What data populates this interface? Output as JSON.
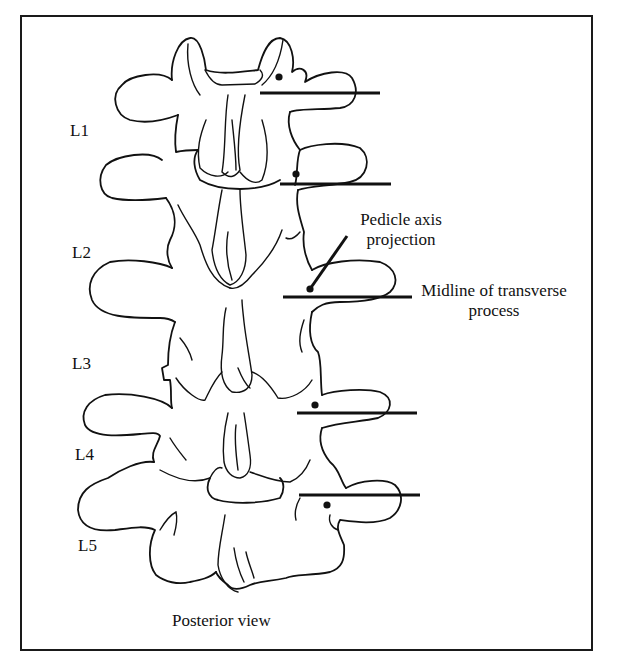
{
  "figure": {
    "view_caption": "Posterior view",
    "vertebra_labels": [
      {
        "id": "L1",
        "text": "L1",
        "x": 70,
        "y": 122
      },
      {
        "id": "L2",
        "text": "L2",
        "x": 72,
        "y": 244
      },
      {
        "id": "L3",
        "text": "L3",
        "x": 72,
        "y": 355
      },
      {
        "id": "L4",
        "text": "L4",
        "x": 75,
        "y": 446
      },
      {
        "id": "L5",
        "text": "L5",
        "x": 78,
        "y": 537
      }
    ],
    "callouts": {
      "pedicle_axis": "Pedicle axis\nprojection",
      "pedicle_axis_line1": "Pedicle axis",
      "pedicle_axis_line2": "projection",
      "transverse_midline_line1": "Midline of transverse",
      "transverse_midline_line2": "process"
    },
    "reference_lines": [
      {
        "level": "L1",
        "x1": 260,
        "x2": 380,
        "y": 93,
        "dot": [
          279,
          77
        ]
      },
      {
        "level": "L2",
        "x1": 280,
        "x2": 391,
        "y": 184,
        "dot": [
          296,
          174
        ]
      },
      {
        "level": "L3",
        "x1": 283,
        "x2": 412,
        "y": 297,
        "dot": [
          310,
          289
        ]
      },
      {
        "level": "L4",
        "x1": 297,
        "x2": 417,
        "y": 413,
        "dot": [
          315,
          405
        ]
      },
      {
        "level": "L5",
        "x1": 299,
        "x2": 420,
        "y": 495,
        "dot": [
          327,
          505
        ]
      }
    ],
    "pedicle_axis_line": {
      "x1": 310,
      "y1": 289,
      "x2": 347,
      "y2": 236
    },
    "colors": {
      "ink": "#111111",
      "background": "#ffffff",
      "frame": "#1a1a1a"
    }
  }
}
